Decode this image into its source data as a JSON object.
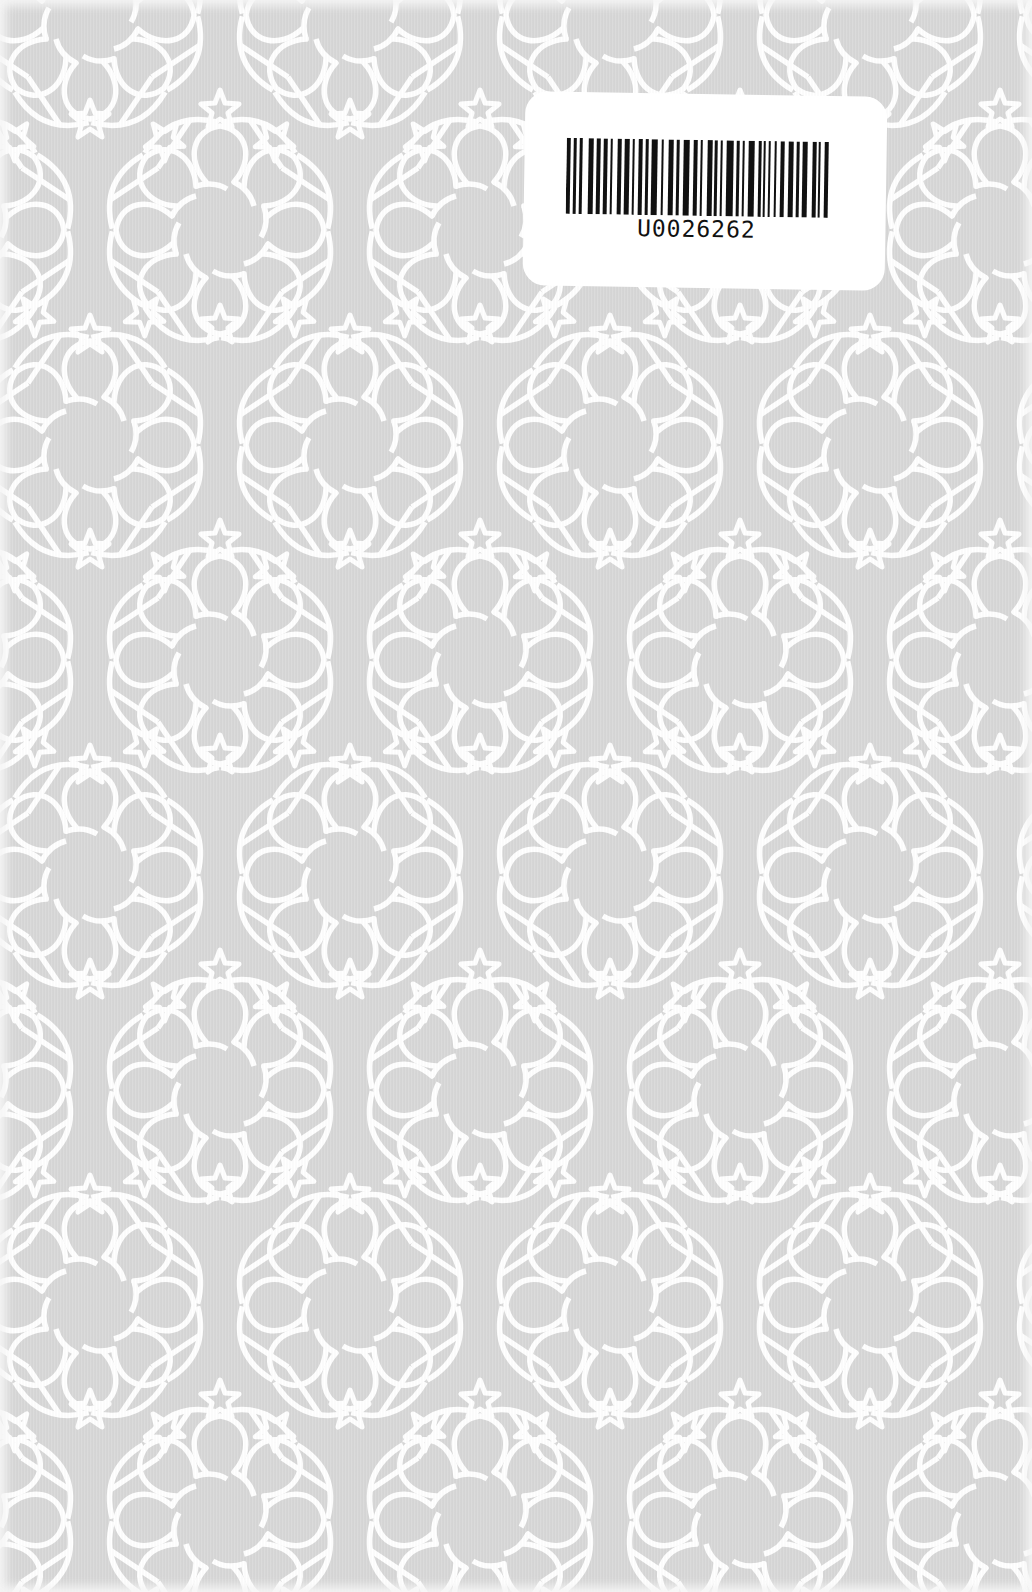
{
  "cover": {
    "background_color": "#d7d7d7",
    "line_color": "#ffffff",
    "pattern": "islamic-geometric-rosette",
    "pattern_period_x": 260,
    "pattern_period_y": 430
  },
  "barcode_label": {
    "code": "U0026262",
    "label_color": "#ffffff",
    "bar_color": "#111111",
    "bars": [
      [
        0,
        4
      ],
      [
        7,
        3
      ],
      [
        13,
        3
      ],
      [
        22,
        5
      ],
      [
        30,
        4
      ],
      [
        37,
        4
      ],
      [
        44,
        2
      ],
      [
        51,
        4
      ],
      [
        58,
        5
      ],
      [
        66,
        2
      ],
      [
        72,
        4
      ],
      [
        79,
        3
      ],
      [
        85,
        6
      ],
      [
        95,
        2
      ],
      [
        102,
        5
      ],
      [
        110,
        3
      ],
      [
        117,
        6
      ],
      [
        127,
        4
      ],
      [
        134,
        2
      ],
      [
        141,
        5
      ],
      [
        148,
        3
      ],
      [
        154,
        2
      ],
      [
        160,
        7
      ],
      [
        170,
        3
      ],
      [
        176,
        2
      ],
      [
        182,
        6
      ],
      [
        192,
        3
      ],
      [
        197,
        2
      ],
      [
        202,
        2
      ],
      [
        208,
        2
      ],
      [
        214,
        4
      ],
      [
        222,
        5
      ],
      [
        230,
        3
      ],
      [
        236,
        5
      ],
      [
        246,
        4
      ],
      [
        252,
        2
      ],
      [
        258,
        4
      ]
    ]
  }
}
